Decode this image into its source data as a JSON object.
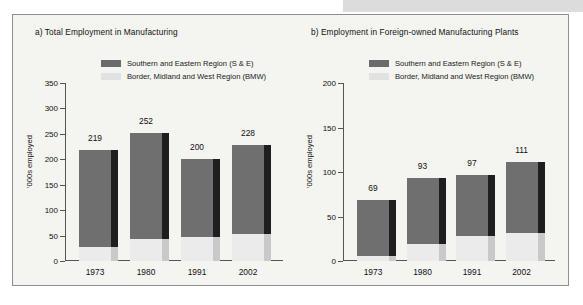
{
  "figure": {
    "background": "#f4f4f1",
    "border_color": "#8f8f8f",
    "top_band_color": "#dcdcdc"
  },
  "legend": {
    "se_label": "Southern and Eastern Region (S & E)",
    "bmw_label": "Border, Midland and West Region (BMW)",
    "se_color": "#6b6b6b",
    "bmw_color": "#e2e2e2",
    "position": "top-center-overlapping-plot"
  },
  "chart_data": [
    {
      "type": "bar",
      "panel": "a",
      "title": "a) Total Employment in Manufacturing",
      "xlabel": "",
      "ylabel": "'000s employed",
      "categories": [
        "1973",
        "1980",
        "1991",
        "2002"
      ],
      "ylim": [
        0,
        350
      ],
      "yticks": [
        0,
        50,
        100,
        150,
        200,
        250,
        300,
        350
      ],
      "grid": false,
      "stacked": true,
      "series": [
        {
          "name": "Border, Midland and West Region (BMW)",
          "values": [
            28,
            43,
            48,
            54
          ]
        },
        {
          "name": "Southern and Eastern Region (S & E)",
          "values": [
            191,
            209,
            152,
            174
          ]
        }
      ],
      "totals": [
        219,
        252,
        200,
        228
      ],
      "data_labels": [
        "219",
        "252",
        "200",
        "228"
      ]
    },
    {
      "type": "bar",
      "panel": "b",
      "title": "b) Employment in Foreign-owned Manufacturing Plants",
      "xlabel": "",
      "ylabel": "'000s employed",
      "categories": [
        "1973",
        "1980",
        "1991",
        "2002"
      ],
      "ylim": [
        0,
        200
      ],
      "yticks": [
        0,
        50,
        100,
        150,
        200
      ],
      "grid": false,
      "stacked": true,
      "series": [
        {
          "name": "Border, Midland and West Region (BMW)",
          "values": [
            6,
            19,
            28,
            32
          ]
        },
        {
          "name": "Southern and Eastern Region (S & E)",
          "values": [
            63,
            74,
            69,
            79
          ]
        }
      ],
      "totals": [
        69,
        93,
        97,
        111
      ],
      "data_labels": [
        "69",
        "93",
        "97",
        "111"
      ]
    }
  ]
}
